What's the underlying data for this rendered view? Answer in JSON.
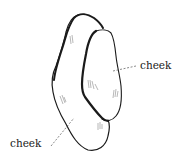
{
  "figure": {
    "labels": [
      {
        "id": "cheek-right",
        "text": "cheek",
        "points_to": "front cheek"
      },
      {
        "id": "cheek-left",
        "text": "cheek",
        "points_to": "back cheek"
      }
    ],
    "colors": {
      "ink": "#1a1a1a",
      "leader": "#555555",
      "background": "#ffffff"
    }
  }
}
